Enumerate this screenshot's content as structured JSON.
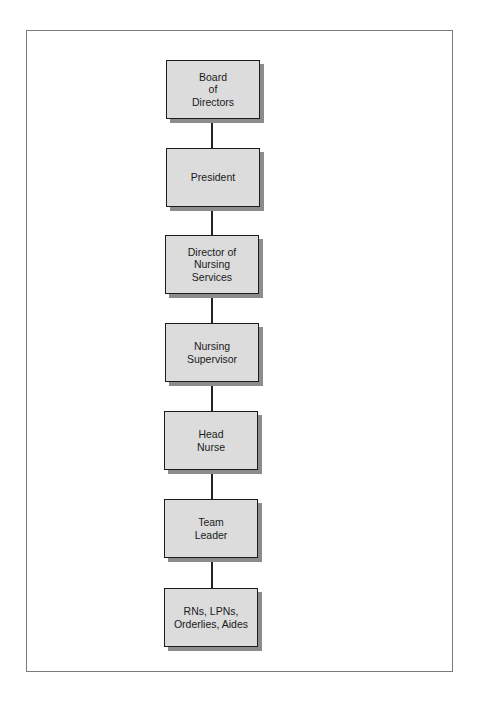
{
  "diagram": {
    "type": "organizational-chart",
    "orientation": "vertical",
    "colors": {
      "node_fill": "#dcdcdc",
      "node_border": "#1c1c1c",
      "node_shadow": "#8c8c8c",
      "connector": "#222222",
      "frame_border": "#7a7a7a"
    },
    "nodes": [
      {
        "id": "board",
        "label": "Board\nof\nDirectors"
      },
      {
        "id": "president",
        "label": "President"
      },
      {
        "id": "director-nursing",
        "label": "Director of\nNursing\nServices"
      },
      {
        "id": "nursing-supervisor",
        "label": "Nursing\nSupervisor"
      },
      {
        "id": "head-nurse",
        "label": "Head\nNurse"
      },
      {
        "id": "team-leader",
        "label": "Team\nLeader"
      },
      {
        "id": "staff",
        "label": "RNs, LPNs,\nOrderlies,  Aides"
      }
    ],
    "edges": [
      [
        "board",
        "president"
      ],
      [
        "president",
        "director-nursing"
      ],
      [
        "director-nursing",
        "nursing-supervisor"
      ],
      [
        "nursing-supervisor",
        "head-nurse"
      ],
      [
        "head-nurse",
        "team-leader"
      ],
      [
        "team-leader",
        "staff"
      ]
    ]
  }
}
